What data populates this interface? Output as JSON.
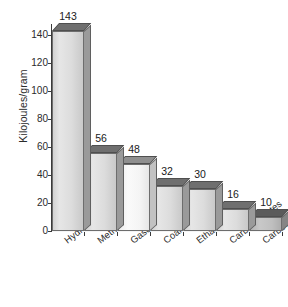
{
  "chart_data": {
    "type": "bar",
    "title": "",
    "xlabel": "",
    "ylabel": "Kilojoules/gram",
    "ylim": [
      0,
      145
    ],
    "yticks": [
      0,
      20,
      40,
      60,
      80,
      100,
      120,
      140
    ],
    "grid": true,
    "legend": false,
    "categories": [
      "Hydrogen",
      "Methane",
      "Gasoline",
      "Coal",
      "Ethanol",
      "Carbohydrates",
      "Carbon monoxide"
    ],
    "values": [
      143,
      56,
      48,
      32,
      30,
      16,
      10
    ],
    "value_labels": [
      "143",
      "56",
      "48",
      "32",
      "30",
      "16",
      "10"
    ],
    "bar_styles": [
      "normal",
      "normal",
      "light",
      "normal",
      "normal",
      "normal",
      "dark"
    ],
    "colors": {
      "bar_front": "#dcdcdc",
      "bar_top": "#6f6f6f",
      "bar_side": "#9a9a9a",
      "bar_light_front": "#f5f5f5",
      "bar_dark_front": "#bfbfbf",
      "axis": "#3a3a3a",
      "gridline": "#ffffff",
      "text": "#1a1a1a",
      "background": "#ffffff"
    }
  }
}
